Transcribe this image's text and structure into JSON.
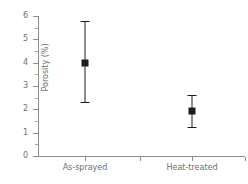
{
  "chart_data": {
    "type": "scatter",
    "title": "",
    "xlabel": "",
    "ylabel": "Porosity (%)",
    "categories": [
      "As-sprayed",
      "Heat-treated"
    ],
    "values": [
      4.0,
      1.95
    ],
    "error_low": [
      2.3,
      1.25
    ],
    "error_high": [
      5.8,
      2.6
    ],
    "error_minus": [
      1.7,
      0.7
    ],
    "error_plus": [
      1.8,
      0.65
    ],
    "ylim": [
      0,
      6
    ],
    "ytick_labels": [
      "0",
      "1",
      "2",
      "3",
      "4",
      "5",
      "6"
    ],
    "ytick_values": [
      0,
      1,
      2,
      3,
      4,
      5,
      6
    ],
    "yminor_values": [
      0.5,
      1.5,
      2.5,
      3.5,
      4.5,
      5.5
    ],
    "grid": false,
    "legend": "none",
    "marker_color": "#1c1c1c",
    "axis_color": "#8d8d8d",
    "text_color": "#6e6e6e"
  }
}
